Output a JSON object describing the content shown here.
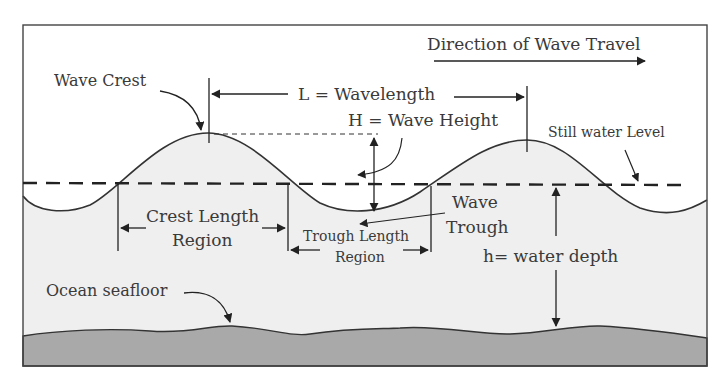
{
  "diagram": {
    "type": "ocean-wave-anatomy",
    "labels": {
      "direction": "Direction of Wave Travel",
      "wave_crest": "Wave Crest",
      "wavelength": "L = Wavelength",
      "wave_height": "H = Wave Height",
      "still_water_level": "Still water Level",
      "crest_length_line1": "Crest Length",
      "crest_length_line2": "Region",
      "trough_length_line1": "Trough Length",
      "trough_length_line2": "Region",
      "wave_trough_line1": "Wave",
      "wave_trough_line2": "Trough",
      "water_depth": "h= water depth",
      "ocean_seafloor": "Ocean seafloor"
    },
    "colors": {
      "stroke": "#333333",
      "water_fill": "#efefef",
      "seafloor_fill": "#a9a9a9",
      "text": "#3a3a3a",
      "background": "#ffffff"
    }
  }
}
